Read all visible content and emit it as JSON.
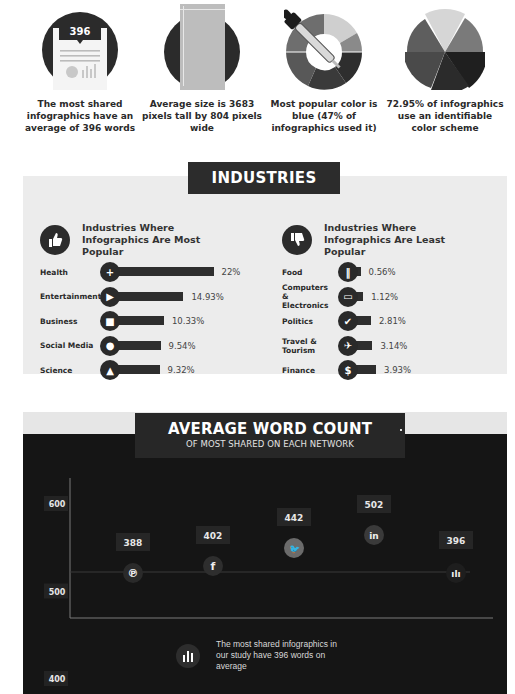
{
  "stats": [
    {
      "icon": "document-icon",
      "badge": "396",
      "caption": "The most shared infographics have an average of 396 words"
    },
    {
      "icon": "tall-page-icon",
      "caption": "Average size is 3683 pixels tall by 804 pixels wide"
    },
    {
      "icon": "color-dropper-icon",
      "caption": "Most popular color is blue (47% of infographics used it)"
    },
    {
      "icon": "color-wheel-icon",
      "caption": "72.95% of infographics use an identifiable color scheme"
    }
  ],
  "industries": {
    "title": "INDUSTRIES",
    "most_popular": {
      "heading": "Industries Where Infographics Are Most Popular",
      "icon": "thumbs-up-icon",
      "items": [
        {
          "label": "Health",
          "value": 22,
          "display": "22%",
          "icon": "plus-icon",
          "glyph": "+"
        },
        {
          "label": "Entertainment",
          "value": 14.93,
          "display": "14.93%",
          "icon": "play-icon",
          "glyph": "▶"
        },
        {
          "label": "Business",
          "value": 10.33,
          "display": "10.33%",
          "icon": "briefcase-icon",
          "glyph": "■"
        },
        {
          "label": "Social Media",
          "value": 9.54,
          "display": "9.54%",
          "icon": "speech-bubble-icon",
          "glyph": "●"
        },
        {
          "label": "Science",
          "value": 9.32,
          "display": "9.32%",
          "icon": "flask-icon",
          "glyph": "▲"
        }
      ]
    },
    "least_popular": {
      "heading": "Industries Where Infographics Are Least Popular",
      "icon": "thumbs-down-icon",
      "items": [
        {
          "label": "Food",
          "value": 0.56,
          "display": "0.56%",
          "icon": "utensils-icon",
          "glyph": "‖"
        },
        {
          "label": "Computers & Electronics",
          "value": 1.12,
          "display": "1.12%",
          "icon": "monitor-icon",
          "glyph": "▭"
        },
        {
          "label": "Politics",
          "value": 2.81,
          "display": "2.81%",
          "icon": "check-icon",
          "glyph": "✔"
        },
        {
          "label": "Travel & Tourism",
          "value": 3.14,
          "display": "3.14%",
          "icon": "airplane-icon",
          "glyph": "✈"
        },
        {
          "label": "Finance",
          "value": 3.93,
          "display": "3.93%",
          "icon": "dollar-icon",
          "glyph": "$"
        }
      ]
    }
  },
  "word_count": {
    "title": "AVERAGE WORD COUNT",
    "subtitle": "OF MOST SHARED ON EACH NETWORK",
    "footer": "The most shared infographics in our study have 396 words on average"
  },
  "chart_data": {
    "type": "scatter",
    "title": "AVERAGE WORD COUNT",
    "subtitle": "OF MOST SHARED ON EACH NETWORK",
    "xlabel": "",
    "ylabel": "",
    "ylim": [
      250,
      650
    ],
    "yticks": [
      "600",
      "500",
      "400",
      "300"
    ],
    "grid": false,
    "reference_line": 396,
    "categories": [
      "Pinterest",
      "Facebook",
      "Twitter",
      "LinkedIn",
      "Overall average"
    ],
    "points": [
      {
        "network": "Pinterest",
        "icon": "pinterest-icon",
        "glyph": "℗",
        "value": 388,
        "label": "388",
        "color": "#2a2a2a"
      },
      {
        "network": "Facebook",
        "icon": "facebook-icon",
        "glyph": "f",
        "value": 402,
        "label": "402",
        "color": "#2e2e2e"
      },
      {
        "network": "Twitter",
        "icon": "twitter-icon",
        "glyph": "🐦",
        "value": 442,
        "label": "442",
        "color": "#6b6b6b"
      },
      {
        "network": "LinkedIn",
        "icon": "linkedin-icon",
        "glyph": "in",
        "value": 502,
        "label": "502",
        "color": "#3a3a3a"
      },
      {
        "network": "Overall average",
        "icon": "bar-chart-icon",
        "glyph": "ılı",
        "value": 396,
        "label": "396",
        "color": "#1e1e1e"
      }
    ]
  },
  "colors": {
    "dark": "#2c2c2c",
    "panel_light": "#ececec",
    "chart_bg": "#151515",
    "text": "#2a2a2a"
  }
}
